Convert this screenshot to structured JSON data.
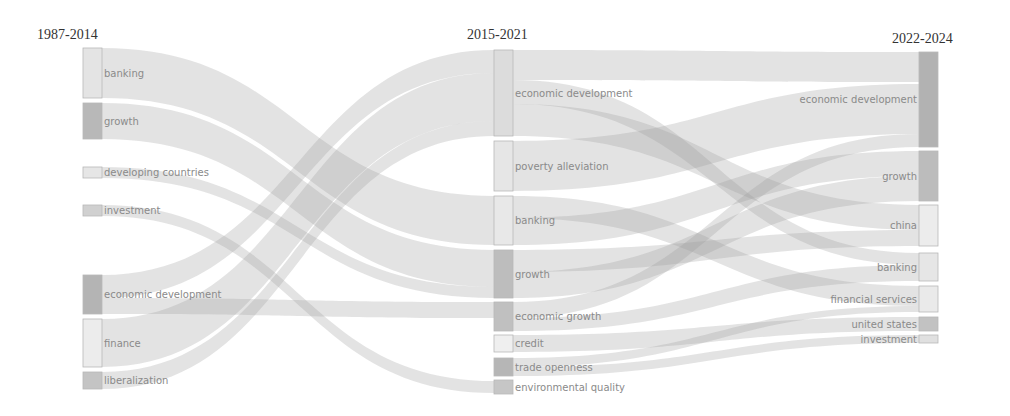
{
  "chart_data": {
    "type": "sankey",
    "title": "",
    "columns": [
      {
        "label": "1987-2014",
        "x": 83,
        "title_x": 37,
        "title_y": 27
      },
      {
        "label": "2015-2021",
        "x": 494,
        "title_x": 467,
        "title_y": 27
      },
      {
        "label": "2022-2024",
        "x": 919,
        "title_x": 892,
        "title_y": 31
      }
    ],
    "node_width": 19,
    "nodes": [
      {
        "id": "c1_banking",
        "col": 0,
        "label": "banking",
        "y0": 48,
        "y1": 98,
        "color": "#e4e4e4",
        "label_side": "right"
      },
      {
        "id": "c1_growth",
        "col": 0,
        "label": "growth",
        "y0": 103,
        "y1": 139,
        "color": "#b8b8b8",
        "label_side": "right"
      },
      {
        "id": "c1_developing",
        "col": 0,
        "label": "developing countries",
        "y0": 167,
        "y1": 178,
        "color": "#e6e6e6",
        "label_side": "right"
      },
      {
        "id": "c1_investment",
        "col": 0,
        "label": "investment",
        "y0": 205,
        "y1": 216,
        "color": "#d0d0d0",
        "label_side": "right"
      },
      {
        "id": "c1_econdev",
        "col": 0,
        "label": "economic development",
        "y0": 275,
        "y1": 314,
        "color": "#b4b4b4",
        "label_side": "right"
      },
      {
        "id": "c1_finance",
        "col": 0,
        "label": "finance",
        "y0": 319,
        "y1": 367,
        "color": "#ececec",
        "label_side": "right"
      },
      {
        "id": "c1_liberalization",
        "col": 0,
        "label": "liberalization",
        "y0": 372,
        "y1": 389,
        "color": "#c4c4c4",
        "label_side": "right"
      },
      {
        "id": "c2_econdev",
        "col": 1,
        "label": "economic development",
        "y0": 50,
        "y1": 136,
        "color": "#dcdcdc",
        "label_side": "right"
      },
      {
        "id": "c2_poverty",
        "col": 1,
        "label": "poverty alleviation",
        "y0": 141,
        "y1": 191,
        "color": "#e6e6e6",
        "label_side": "right"
      },
      {
        "id": "c2_banking",
        "col": 1,
        "label": "banking",
        "y0": 196,
        "y1": 245,
        "color": "#e8e8e8",
        "label_side": "right"
      },
      {
        "id": "c2_growth",
        "col": 1,
        "label": "growth",
        "y0": 250,
        "y1": 298,
        "color": "#bdbdbd",
        "label_side": "right"
      },
      {
        "id": "c2_econgrowth",
        "col": 1,
        "label": "economic growth",
        "y0": 302,
        "y1": 331,
        "color": "#c0c0c0",
        "label_side": "right"
      },
      {
        "id": "c2_credit",
        "col": 1,
        "label": "credit",
        "y0": 335,
        "y1": 352,
        "color": "#efefef",
        "label_side": "right"
      },
      {
        "id": "c2_trade",
        "col": 1,
        "label": "trade openness",
        "y0": 358,
        "y1": 376,
        "color": "#b6b6b6",
        "label_side": "right"
      },
      {
        "id": "c2_env",
        "col": 1,
        "label": "environmental quality",
        "y0": 380,
        "y1": 394,
        "color": "#c6c6c6",
        "label_side": "right"
      },
      {
        "id": "c3_econdev",
        "col": 2,
        "label": "economic development",
        "y0": 52,
        "y1": 147,
        "color": "#b2b2b2",
        "label_side": "left"
      },
      {
        "id": "c3_growth",
        "col": 2,
        "label": "growth",
        "y0": 151,
        "y1": 201,
        "color": "#bcbcbc",
        "label_side": "left"
      },
      {
        "id": "c3_china",
        "col": 2,
        "label": "china",
        "y0": 205,
        "y1": 246,
        "color": "#ececec",
        "label_side": "left"
      },
      {
        "id": "c3_banking",
        "col": 2,
        "label": "banking",
        "y0": 253,
        "y1": 281,
        "color": "#e6e6e6",
        "label_side": "left"
      },
      {
        "id": "c3_finserv",
        "col": 2,
        "label": "financial services",
        "y0": 286,
        "y1": 312,
        "color": "#eaeaea",
        "label_side": "left"
      },
      {
        "id": "c3_us",
        "col": 2,
        "label": "united states",
        "y0": 317,
        "y1": 331,
        "color": "#c2c2c2",
        "label_side": "left"
      },
      {
        "id": "c3_investment",
        "col": 2,
        "label": "investment",
        "y0": 335,
        "y1": 343,
        "color": "#e0e0e0",
        "label_side": "left"
      }
    ],
    "links": [
      {
        "source": "c1_banking",
        "s0": 48,
        "s1": 98,
        "target": "c2_banking",
        "t0": 196,
        "t1": 245
      },
      {
        "source": "c1_growth",
        "s0": 103,
        "s1": 139,
        "target": "c2_growth",
        "t0": 250,
        "t1": 287
      },
      {
        "source": "c1_developing",
        "s0": 167,
        "s1": 178,
        "target": "c2_growth",
        "t0": 287,
        "t1": 298
      },
      {
        "source": "c1_investment",
        "s0": 205,
        "s1": 216,
        "target": "c2_env",
        "t0": 381,
        "t1": 393
      },
      {
        "source": "c1_econdev",
        "s0": 275,
        "s1": 298,
        "target": "c2_econdev",
        "t0": 50,
        "t1": 73
      },
      {
        "source": "c1_econdev",
        "s0": 298,
        "s1": 314,
        "target": "c2_econgrowth",
        "t0": 302,
        "t1": 318
      },
      {
        "source": "c1_finance",
        "s0": 319,
        "s1": 367,
        "target": "c2_econdev",
        "t0": 73,
        "t1": 121
      },
      {
        "source": "c1_liberalization",
        "s0": 372,
        "s1": 389,
        "target": "c2_econdev",
        "t0": 121,
        "t1": 136
      },
      {
        "source": "c2_econdev",
        "s0": 50,
        "s1": 80,
        "target": "c3_econdev",
        "t0": 52,
        "t1": 82
      },
      {
        "source": "c2_econdev",
        "s0": 80,
        "s1": 104,
        "target": "c3_banking",
        "t0": 253,
        "t1": 265
      },
      {
        "source": "c2_econdev",
        "s0": 104,
        "s1": 136,
        "target": "c3_china",
        "t0": 205,
        "t1": 230
      },
      {
        "source": "c2_poverty",
        "s0": 141,
        "s1": 191,
        "target": "c3_econdev",
        "t0": 84,
        "t1": 134
      },
      {
        "source": "c2_banking",
        "s0": 196,
        "s1": 218,
        "target": "c3_finserv",
        "t0": 286,
        "t1": 306
      },
      {
        "source": "c2_banking",
        "s0": 218,
        "s1": 245,
        "target": "c3_growth",
        "t0": 151,
        "t1": 176
      },
      {
        "source": "c2_growth",
        "s0": 250,
        "s1": 272,
        "target": "c3_china",
        "t0": 230,
        "t1": 246
      },
      {
        "source": "c2_growth",
        "s0": 272,
        "s1": 298,
        "target": "c3_growth",
        "t0": 176,
        "t1": 201
      },
      {
        "source": "c2_econgrowth",
        "s0": 302,
        "s1": 318,
        "target": "c3_econdev",
        "t0": 134,
        "t1": 147
      },
      {
        "source": "c2_econgrowth",
        "s0": 318,
        "s1": 331,
        "target": "c3_banking",
        "t0": 265,
        "t1": 281
      },
      {
        "source": "c2_credit",
        "s0": 335,
        "s1": 352,
        "target": "c3_us",
        "t0": 317,
        "t1": 331
      },
      {
        "source": "c2_trade",
        "s0": 358,
        "s1": 367,
        "target": "c3_finserv",
        "t0": 306,
        "t1": 312
      },
      {
        "source": "c2_trade",
        "s0": 367,
        "s1": 376,
        "target": "c3_investment",
        "t0": 335,
        "t1": 343
      }
    ]
  }
}
